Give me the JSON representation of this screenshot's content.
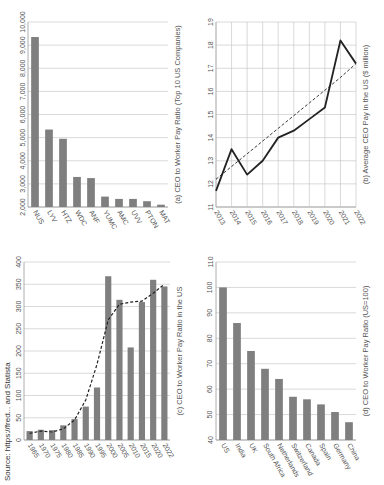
{
  "chart_data": [
    {
      "id": "a",
      "type": "bar",
      "title": "(a) CEO to Worker Pay Ratio (Top 10 US Companies)",
      "categories": [
        "NUS",
        "LYV",
        "HTZ",
        "WDC",
        "ANF",
        "YUMC",
        "AMC",
        "UVV",
        "PTON",
        "MAT"
      ],
      "values": [
        9350,
        5350,
        4950,
        3300,
        3250,
        2450,
        2350,
        2350,
        2250,
        2100
      ],
      "xlabel": "",
      "ylabel": "",
      "ylim": [
        2000,
        10000
      ],
      "yticks": [
        "2,000",
        "3,000",
        "4,000",
        "5,000",
        "6,000",
        "7,000",
        "8,000",
        "9,000",
        "10,000"
      ],
      "grid": true,
      "bar_color": "#7f7f7f"
    },
    {
      "id": "b",
      "type": "line",
      "title": "(b) Average CEO Pay in the US ($ million)",
      "x": [
        "2013",
        "2014",
        "2015",
        "2016",
        "2017",
        "2018",
        "2019",
        "2020",
        "2021",
        "2022"
      ],
      "series": [
        {
          "name": "Average CEO Pay",
          "values": [
            11.7,
            13.5,
            12.4,
            13.0,
            14.0,
            14.3,
            14.8,
            15.3,
            18.2,
            17.2
          ],
          "style": "solid"
        },
        {
          "name": "Trend",
          "values": [
            12.2,
            12.75,
            13.3,
            13.85,
            14.4,
            14.95,
            15.5,
            16.05,
            16.6,
            17.2
          ],
          "style": "dashed"
        }
      ],
      "ylim": [
        11,
        19
      ],
      "yticks": [
        "11",
        "12",
        "13",
        "14",
        "15",
        "16",
        "17",
        "18",
        "19"
      ],
      "grid": true
    },
    {
      "id": "c",
      "type": "bar",
      "title": "(c) CEO to Worker Pay Ratio in the US",
      "categories": [
        "1965",
        "1970",
        "1975",
        "1980",
        "1985",
        "1990",
        "1995",
        "2000",
        "2005",
        "2010",
        "2015",
        "2020",
        "2022"
      ],
      "values": [
        20,
        23,
        22,
        33,
        47,
        75,
        118,
        368,
        315,
        208,
        310,
        360,
        345
      ],
      "trend": [
        15,
        20,
        18,
        25,
        45,
        90,
        170,
        270,
        305,
        310,
        312,
        330,
        350
      ],
      "ylim": [
        0,
        400
      ],
      "yticks": [
        "0",
        "50",
        "100",
        "150",
        "200",
        "250",
        "300",
        "350",
        "400"
      ],
      "grid": true,
      "bar_color": "#7f7f7f"
    },
    {
      "id": "d",
      "type": "bar",
      "title": "(d) CEO to Worker Pay Ratio (US=100)",
      "categories": [
        "US",
        "India",
        "UK",
        "South Africa",
        "Netherlands",
        "Switzerland",
        "Canada",
        "Spain",
        "Germany",
        "China"
      ],
      "values": [
        100,
        86,
        75,
        68,
        64,
        57,
        56,
        54,
        51,
        47
      ],
      "ylim": [
        40,
        110
      ],
      "yticks": [
        "40",
        "50",
        "60",
        "70",
        "80",
        "90",
        "100",
        "110"
      ],
      "grid": true,
      "bar_color": "#7f7f7f"
    }
  ],
  "footer": {
    "text": "Source: https://fred... and Statista"
  }
}
